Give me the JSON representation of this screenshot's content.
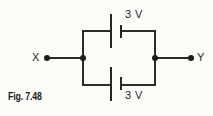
{
  "figure": {
    "caption": "Fig. 7.48",
    "type": "circuit-diagram"
  },
  "terminals": {
    "left": {
      "label": "X"
    },
    "right": {
      "label": "Y"
    }
  },
  "cells": [
    {
      "position": "top",
      "label": "3 V",
      "voltage": 3,
      "unit": "V"
    },
    {
      "position": "bottom",
      "label": "3 V",
      "voltage": 3,
      "unit": "V"
    }
  ],
  "colors": {
    "background": "#fbfbf8",
    "line": "#2b2b2b",
    "plate": "#262626",
    "node": "#1c1c1c",
    "text": "#1f1f1f",
    "caption": "#1a1a1a"
  }
}
